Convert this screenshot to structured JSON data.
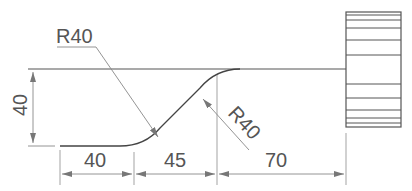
{
  "drawing": {
    "title": "Profile with R40 fillets and knurled end",
    "line_color": "#555555",
    "dim_color": "#888888",
    "dimensions": {
      "height_left": "40",
      "horiz_1": "40",
      "horiz_2": "45",
      "horiz_3": "70",
      "radius_top_left": "R40",
      "radius_lower_right": "R40"
    }
  }
}
